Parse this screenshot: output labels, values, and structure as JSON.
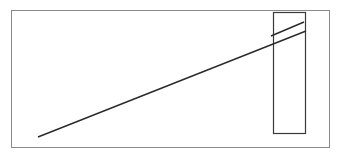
{
  "diagram": {
    "type": "line-drawing",
    "colors": {
      "background": "#ffffff",
      "frame": "#8a8a8a",
      "stroke": "#2a2a2a"
    },
    "frame": {
      "x": 11,
      "y": 10,
      "width": 318,
      "height": 137
    },
    "block": {
      "x": 273,
      "y": 12,
      "width": 32,
      "height": 121
    },
    "lines": [
      {
        "name": "long-incline-line",
        "x1": 38,
        "y1": 137,
        "x2": 306,
        "y2": 31
      },
      {
        "name": "short-parallel-line",
        "x1": 271,
        "y1": 36,
        "x2": 304,
        "y2": 22
      }
    ]
  }
}
